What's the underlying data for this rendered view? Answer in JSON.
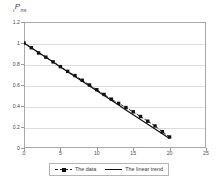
{
  "chart_data": {
    "type": "line",
    "title": "",
    "axis_title": "ıP ns",
    "axis_title_main": "P",
    "axis_title_prefix": "ı",
    "axis_title_suffix": "ns",
    "xlabel": "",
    "ylabel": "",
    "xlim": [
      0,
      25
    ],
    "ylim": [
      0,
      1.2
    ],
    "xticks": [
      "0",
      "5",
      "10",
      "15",
      "20",
      "25"
    ],
    "xtick_values": [
      0,
      5,
      10,
      15,
      20,
      25
    ],
    "yticks": [
      "0",
      "0.2",
      "0.4",
      "0.6",
      "0.8",
      "1",
      "1.2"
    ],
    "ytick_values": [
      0,
      0.2,
      0.4,
      0.6,
      0.8,
      1,
      1.2
    ],
    "grid": "horizontal",
    "legend_position": "bottom",
    "x": [
      0,
      1,
      2,
      3,
      4,
      5,
      6,
      7,
      8,
      9,
      10,
      11,
      12,
      13,
      14,
      15,
      16,
      17,
      18,
      19,
      20
    ],
    "series": [
      {
        "name": "The data",
        "marker": "square",
        "linestyle": "dashed",
        "color": "#111111",
        "values": [
          1.0,
          0.955,
          0.905,
          0.865,
          0.82,
          0.775,
          0.73,
          0.69,
          0.645,
          0.6,
          0.555,
          0.51,
          0.465,
          0.425,
          0.385,
          0.345,
          0.3,
          0.255,
          0.21,
          0.155,
          0.105
        ]
      },
      {
        "name": "The linear trend",
        "marker": "none",
        "linestyle": "solid",
        "color": "#111111",
        "values": [
          1.0,
          0.9545,
          0.909,
          0.8635,
          0.818,
          0.7725,
          0.727,
          0.6815,
          0.636,
          0.5905,
          0.545,
          0.4995,
          0.454,
          0.4085,
          0.363,
          0.3175,
          0.272,
          0.2265,
          0.181,
          0.1355,
          0.09
        ]
      }
    ]
  },
  "legend": {
    "items": [
      {
        "label": "The data"
      },
      {
        "label": "The linear trend"
      }
    ]
  }
}
